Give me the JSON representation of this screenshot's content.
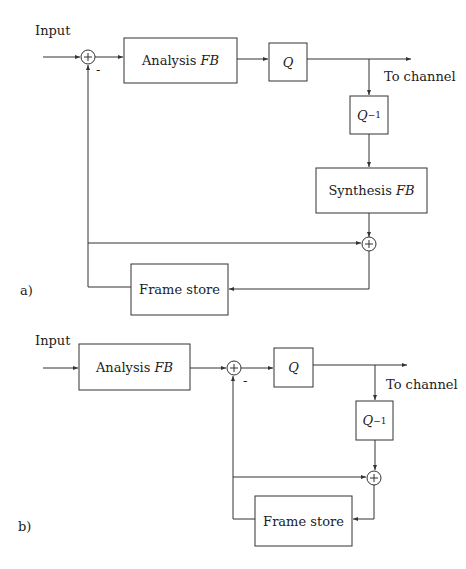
{
  "diagram_a": {
    "label": "a)",
    "input_label": "Input",
    "analysis": "Analysis",
    "analysis_fb": "FB",
    "q": "Q",
    "qinv": "Q",
    "qinv_exp": "−1",
    "synthesis": "Synthesis",
    "synthesis_fb": "FB",
    "frame_store": "Frame store",
    "to_channel": "To channel",
    "minus": "-"
  },
  "diagram_b": {
    "label": "b)",
    "input_label": "Input",
    "analysis": "Analysis",
    "analysis_fb": "FB",
    "q": "Q",
    "qinv": "Q",
    "qinv_exp": "−1",
    "frame_store": "Frame store",
    "to_channel": "To channel",
    "minus": "-"
  }
}
